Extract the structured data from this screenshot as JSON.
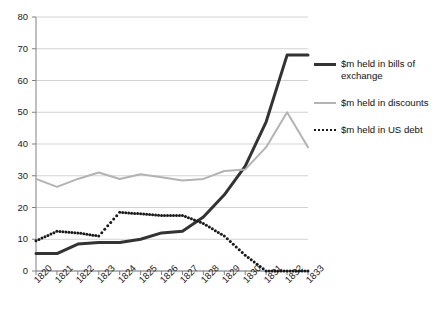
{
  "chart_data": {
    "type": "line",
    "title": "",
    "subtitle": "",
    "xlabel": "",
    "ylabel": "",
    "categories": [
      "1820",
      "1821",
      "1822",
      "1823",
      "1824",
      "1825",
      "1826",
      "1827",
      "1828",
      "1829",
      "1830",
      "1831",
      "1832",
      "1833"
    ],
    "ylim": [
      0,
      80
    ],
    "yticks": [
      0,
      10,
      20,
      30,
      40,
      50,
      60,
      70,
      80
    ],
    "grid": "horizontal",
    "legend_position": "right",
    "series": [
      {
        "name": "$m held in bills of exchange",
        "style": "solid-thick",
        "color": "#333333",
        "values": [
          5.5,
          5.5,
          8.5,
          9.0,
          9.0,
          10.0,
          12.0,
          12.5,
          17.0,
          24.0,
          33.0,
          47.0,
          68.0,
          68.0
        ]
      },
      {
        "name": "$m held in discounts",
        "style": "solid-thin",
        "color": "#b3b3b3",
        "values": [
          29.0,
          26.5,
          29.0,
          31.0,
          29.0,
          30.5,
          29.5,
          28.5,
          29.0,
          31.5,
          32.0,
          39.0,
          50.0,
          39.0
        ]
      },
      {
        "name": "$m held in US debt",
        "style": "dotted",
        "color": "#1a1a1a",
        "values": [
          9.5,
          12.5,
          12.0,
          11.0,
          18.5,
          18.0,
          17.5,
          17.5,
          15.0,
          11.0,
          5.0,
          0.0,
          0.0,
          0.0
        ]
      }
    ]
  },
  "legend": {
    "items": [
      {
        "label": "$m held in bills of exchange",
        "marker": "line-dark-thick"
      },
      {
        "label": "$m held in discounts",
        "marker": "line-gray-thin"
      },
      {
        "label": "$m held in US debt",
        "marker": "line-dotted"
      }
    ]
  },
  "colors": {
    "bills_of_exchange": "#333333",
    "discounts": "#b3b3b3",
    "us_debt": "#1a1a1a",
    "gridline": "#c8c8c8",
    "axis": "#808080",
    "text": "#1a1a1a",
    "background": "#ffffff"
  }
}
